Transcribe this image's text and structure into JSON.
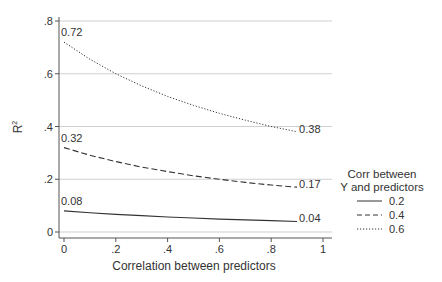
{
  "chart_data": {
    "type": "line",
    "title": "",
    "xlabel": "Correlation between predictors",
    "ylabel": "R²",
    "ylabel_base": "R",
    "ylabel_sup": "2",
    "xlim": [
      0,
      1
    ],
    "ylim": [
      0,
      0.8
    ],
    "grid": true,
    "legend_position": "right",
    "x_ticks": [
      0,
      0.2,
      0.4,
      0.6,
      0.8,
      1
    ],
    "x_tick_labels": [
      "0",
      ".2",
      ".4",
      ".6",
      ".8",
      "1"
    ],
    "y_ticks": [
      0,
      0.2,
      0.4,
      0.6,
      0.8
    ],
    "y_tick_labels": [
      "0",
      ".2",
      ".4",
      ".6",
      ".8"
    ],
    "legend_title_line1": "Corr between",
    "legend_title_line2": "Y and predictors",
    "x": [
      0,
      0.1,
      0.2,
      0.3,
      0.4,
      0.5,
      0.6,
      0.7,
      0.8,
      0.9
    ],
    "series": [
      {
        "name": "0.2",
        "style": "solid",
        "values": [
          0.08,
          0.073,
          0.067,
          0.062,
          0.057,
          0.053,
          0.049,
          0.046,
          0.043,
          0.04
        ],
        "start_label": "0.08",
        "end_label": "0.04"
      },
      {
        "name": "0.4",
        "style": "dashed",
        "values": [
          0.32,
          0.291,
          0.267,
          0.246,
          0.229,
          0.213,
          0.2,
          0.188,
          0.178,
          0.17
        ],
        "start_label": "0.32",
        "end_label": "0.17"
      },
      {
        "name": "0.6",
        "style": "dotted",
        "values": [
          0.72,
          0.655,
          0.6,
          0.554,
          0.514,
          0.48,
          0.45,
          0.424,
          0.4,
          0.38
        ],
        "start_label": "0.72",
        "end_label": "0.38"
      }
    ]
  }
}
